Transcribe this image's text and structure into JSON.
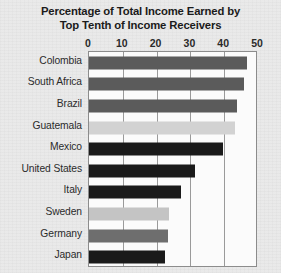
{
  "chart_data": {
    "type": "bar",
    "orientation": "horizontal",
    "title": "Percentage of Total Income Earned by Top Tenth of Income Receivers",
    "title_lines": [
      "Percentage of Total Income Earned by",
      "Top Tenth of Income Receivers"
    ],
    "xlabel": "",
    "ylabel": "",
    "xlim": [
      0,
      50
    ],
    "xticks": [
      0,
      10,
      20,
      30,
      40,
      50
    ],
    "xtick_labels": [
      "0",
      "10",
      "20",
      "30",
      "40",
      "50"
    ],
    "grid": true,
    "legend": false,
    "categories": [
      "Colombia",
      "South Africa",
      "Brazil",
      "Guatemala",
      "Mexico",
      "United States",
      "Italy",
      "Sweden",
      "Germany",
      "Japan"
    ],
    "values": [
      46.7,
      46.0,
      43.8,
      43.2,
      39.5,
      31.5,
      27.2,
      23.7,
      23.3,
      22.4
    ],
    "bar_colors": [
      "#5b5b5b",
      "#5b5b5b",
      "#5b5b5b",
      "#d2d2d2",
      "#1a1a1a",
      "#1a1a1a",
      "#1a1a1a",
      "#c4c4c4",
      "#6e6e6e",
      "#1a1a1a"
    ]
  },
  "colors": {
    "background": "#e9e9e9",
    "plot_background": "#fbfbfb",
    "plot_border": "#8c8c8c",
    "gridline": "#9a9a9a",
    "title_text": "#1b1b1b",
    "tick_text": "#2a2a2a",
    "label_text": "#2b2b2b"
  }
}
